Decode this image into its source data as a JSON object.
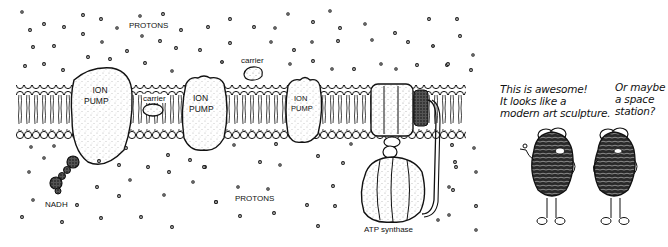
{
  "diagram": {
    "title": "",
    "labels": {
      "protons_top": "PROTONS",
      "protons_bottom": "PROTONS",
      "ion_pump_1": [
        "ION",
        "PUMP"
      ],
      "ion_pump_2": [
        "ION",
        "PUMP"
      ],
      "ion_pump_3": [
        "ION",
        "PUMP"
      ],
      "carrier_in_membrane": "carrier",
      "carrier_above": "carrier",
      "nadh": "NADH",
      "atp_synthase": "ATP synthase"
    },
    "cartoon": {
      "speech_left": [
        "This is awesome!",
        "It looks like a",
        "modern art sculpture."
      ],
      "speech_right": [
        "Or maybe",
        "a space",
        "station?"
      ]
    },
    "colors": {
      "ink": "#111111",
      "background": "#ffffff"
    }
  }
}
